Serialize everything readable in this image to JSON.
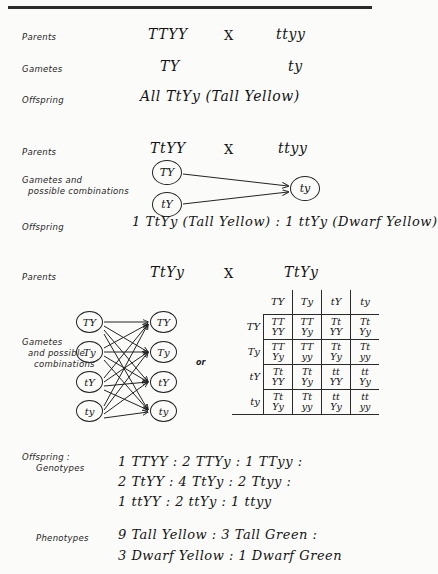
{
  "document": {
    "title": "Dihybrid Cross Genetics Notes"
  },
  "sections": {
    "first_cross": {
      "parents_label": "Parents",
      "parents_left": "TTYY",
      "cross_symbol": "X",
      "parents_right": "ttyy",
      "gametes_label": "Gametes",
      "gamete_left": "TY",
      "gamete_right": "ty",
      "offspring_label": "Offspring",
      "offspring_text": "All  TtYy (Tall Yellow)"
    },
    "second_cross": {
      "parents_label": "Parents",
      "parents_left": "TtYY",
      "cross_symbol": "X",
      "parents_right": "ttyy",
      "gametes_label_line1": "Gametes and",
      "gametes_label_line2": "possible combinations",
      "left_gametes": [
        "TY",
        "tY"
      ],
      "right_gametes": [
        "ty"
      ],
      "offspring_label": "Offspring",
      "offspring_text": "1 TtYy (Tall Yellow) : 1 ttYy (Dwarf Yellow)"
    },
    "third_cross": {
      "parents_label": "Parents",
      "parents_left": "TtYy",
      "cross_symbol": "X",
      "parents_right": "TtYy",
      "gametes_label_line1": "Gametes",
      "gametes_label_line2": "and possible",
      "gametes_label_line3": "combinations",
      "left_gametes": [
        "TY",
        "Ty",
        "tY",
        "ty"
      ],
      "right_gametes": [
        "TY",
        "Ty",
        "tY",
        "ty"
      ],
      "or_label": "or"
    },
    "results": {
      "offspring_label_line1": "Offspring :",
      "offspring_label_line2": "Genotypes",
      "genotype_lines": [
        "1 TTYY : 2 TTYy : 1 TTyy :",
        "2 TtYY : 4 TtYy : 2 Ttyy :",
        "1 ttYY : 2 ttYy : 1 ttyy"
      ],
      "phenotypes_label": "Phenotypes",
      "phenotype_lines": [
        "9 Tall Yellow  :  3 Tall Green :",
        "3 Dwarf Yellow  :  1 Dwarf Green"
      ]
    }
  },
  "punnett_square": {
    "column_headers": [
      "TY",
      "Ty",
      "tY",
      "ty"
    ],
    "row_headers": [
      "TY",
      "Ty",
      "tY",
      "ty"
    ],
    "cells": [
      [
        [
          "TT",
          "YY"
        ],
        [
          "TT",
          "Yy"
        ],
        [
          "Tt",
          "YY"
        ],
        [
          "Tt",
          "Yy"
        ]
      ],
      [
        [
          "TT",
          "Yy"
        ],
        [
          "TT",
          "yy"
        ],
        [
          "Tt",
          "Yy"
        ],
        [
          "Tt",
          "yy"
        ]
      ],
      [
        [
          "Tt",
          "YY"
        ],
        [
          "Tt",
          "Yy"
        ],
        [
          "tt",
          "YY"
        ],
        [
          "tt",
          "Yy"
        ]
      ],
      [
        [
          "Tt",
          "Yy"
        ],
        [
          "Tt",
          "yy"
        ],
        [
          "tt",
          "Yy"
        ],
        [
          "tt",
          "yy"
        ]
      ]
    ]
  },
  "colors": {
    "ink": "#141414",
    "paper": "#fbfbf9",
    "rule": "#2b2b2b"
  }
}
